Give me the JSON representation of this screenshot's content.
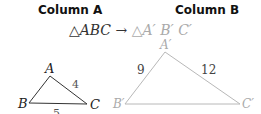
{
  "headers": {
    "column_a": "Column A",
    "column_b": "Column B"
  },
  "mapping": {
    "source": "△ABC",
    "arrow": " →",
    "target": "△A′ B′ C′"
  },
  "triangle_small": {
    "vertices": {
      "A": "A",
      "B": "B",
      "C": "C"
    },
    "sides": {
      "AC": "4",
      "BC": "5"
    }
  },
  "triangle_large": {
    "vertices": {
      "A": "A′",
      "B": "B′",
      "C": "C′"
    },
    "sides": {
      "AB": "9",
      "AC": "12"
    }
  },
  "colors": {
    "small": "#333333",
    "large": "#b0b0b0"
  }
}
